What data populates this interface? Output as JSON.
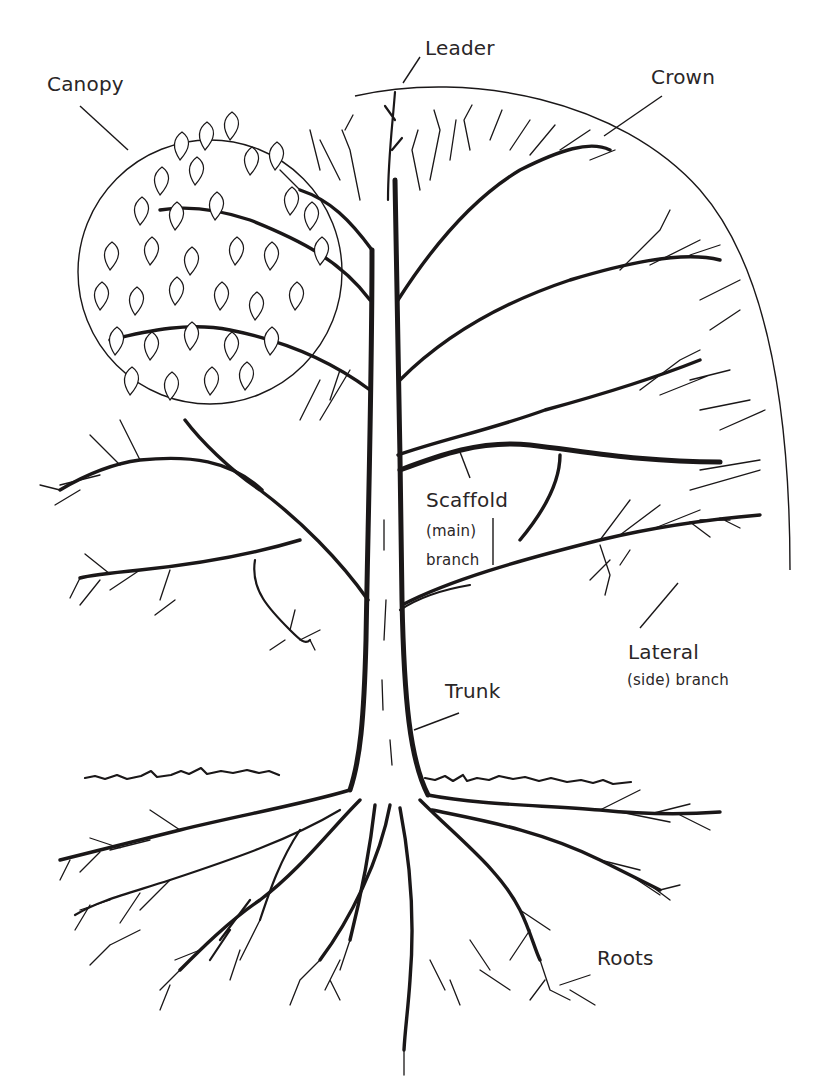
{
  "diagram": {
    "colors": {
      "ink": "#1a1718",
      "label_text": "#2a2627",
      "background": "#ffffff"
    },
    "labels": {
      "leader": "Leader",
      "canopy": "Canopy",
      "crown": "Crown",
      "scaffold_line1": "Scaffold",
      "scaffold_line2": "(main)",
      "scaffold_line3": "branch",
      "lateral_line1": "Lateral",
      "lateral_line2": "(side) branch",
      "trunk": "Trunk",
      "roots": "Roots"
    }
  }
}
